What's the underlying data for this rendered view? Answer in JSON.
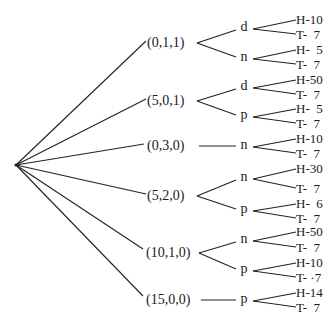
{
  "diagram": {
    "type": "tree",
    "orientation": "left-to-right",
    "root": {
      "x": 16,
      "y": 165
    },
    "level1": [
      {
        "label": "(0,1,1)",
        "x": 147,
        "y": 43,
        "ax": 146,
        "ex": 197
      },
      {
        "label": "(5,0,1)",
        "x": 147,
        "y": 101,
        "ax": 146,
        "ex": 197
      },
      {
        "label": "(0,3,0)",
        "x": 147,
        "y": 146,
        "ax": 144,
        "ex": 197
      },
      {
        "label": "(5,2,0)",
        "x": 147,
        "y": 196,
        "ax": 146,
        "ex": 197
      },
      {
        "label": "(10,1,0)",
        "x": 146,
        "y": 253,
        "ax": 143,
        "ex": 199
      },
      {
        "label": "(15,0,0)",
        "x": 146,
        "y": 300,
        "ax": 143,
        "ex": 199
      }
    ],
    "level2": [
      {
        "label": "d",
        "parent": 0,
        "x": 244,
        "y": 28
      },
      {
        "label": "n",
        "parent": 0,
        "x": 244,
        "y": 58
      },
      {
        "label": "d",
        "parent": 1,
        "x": 244,
        "y": 87
      },
      {
        "label": "p",
        "parent": 1,
        "x": 244,
        "y": 116
      },
      {
        "label": "n",
        "parent": 2,
        "x": 244,
        "y": 146
      },
      {
        "label": "n",
        "parent": 3,
        "x": 244,
        "y": 178
      },
      {
        "label": "p",
        "parent": 3,
        "x": 244,
        "y": 210
      },
      {
        "label": "n",
        "parent": 4,
        "x": 244,
        "y": 240
      },
      {
        "label": "p",
        "parent": 4,
        "x": 244,
        "y": 270
      },
      {
        "label": "p",
        "parent": 5,
        "x": 244,
        "y": 300
      }
    ],
    "leaves": [
      {
        "label": "H-10",
        "parent": 0,
        "y": 19
      },
      {
        "label": "T-  7",
        "parent": 0,
        "y": 34
      },
      {
        "label": "H-  5",
        "parent": 1,
        "y": 49
      },
      {
        "label": "T-  7",
        "parent": 1,
        "y": 64
      },
      {
        "label": "H-50",
        "parent": 2,
        "y": 79
      },
      {
        "label": "T-  7",
        "parent": 2,
        "y": 94
      },
      {
        "label": "H-  5",
        "parent": 3,
        "y": 108
      },
      {
        "label": "T-  7",
        "parent": 3,
        "y": 123
      },
      {
        "label": "H-10",
        "parent": 4,
        "y": 138
      },
      {
        "label": "T-  7",
        "parent": 4,
        "y": 153
      },
      {
        "label": "H-30",
        "parent": 5,
        "y": 168
      },
      {
        "label": "T-  7",
        "parent": 5,
        "y": 188
      },
      {
        "label": "H-  6",
        "parent": 6,
        "y": 203
      },
      {
        "label": "T-  7",
        "parent": 6,
        "y": 218
      },
      {
        "label": "H-50",
        "parent": 7,
        "y": 231
      },
      {
        "label": "T-  7",
        "parent": 7,
        "y": 247
      },
      {
        "label": "H-10",
        "parent": 8,
        "y": 262
      },
      {
        "label": "T- ·7",
        "parent": 8,
        "y": 277
      },
      {
        "label": "H-14",
        "parent": 9,
        "y": 292
      },
      {
        "label": "T-  7",
        "parent": 9,
        "y": 307
      }
    ],
    "leaf_x": 296,
    "line_color": "#222222"
  }
}
